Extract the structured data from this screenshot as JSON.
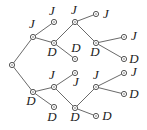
{
  "diagram": {
    "type": "tree",
    "nodes": [
      {
        "id": "root",
        "label": ""
      },
      {
        "id": "n1",
        "label": "J",
        "parent": "root"
      },
      {
        "id": "n2",
        "label": "D",
        "parent": "root"
      },
      {
        "id": "n3",
        "label": "J",
        "parent": "n1"
      },
      {
        "id": "n4",
        "label": "D",
        "parent": "n1"
      },
      {
        "id": "n5",
        "label": "J",
        "parent": "n4"
      },
      {
        "id": "n6",
        "label": "D",
        "parent": "n4"
      },
      {
        "id": "n7",
        "label": "J",
        "parent": "n5"
      },
      {
        "id": "n8",
        "label": "D",
        "parent": "n5"
      },
      {
        "id": "n9",
        "label": "J",
        "parent": "n8"
      },
      {
        "id": "n10",
        "label": "D",
        "parent": "n8"
      },
      {
        "id": "n11",
        "label": "J",
        "parent": "n2"
      },
      {
        "id": "n12",
        "label": "D",
        "parent": "n2"
      },
      {
        "id": "n13",
        "label": "J",
        "parent": "n11"
      },
      {
        "id": "n14",
        "label": "D",
        "parent": "n11"
      },
      {
        "id": "n15",
        "label": "J",
        "parent": "n14"
      },
      {
        "id": "n16",
        "label": "D",
        "parent": "n14"
      },
      {
        "id": "n17",
        "label": "J",
        "parent": "n15"
      },
      {
        "id": "n18",
        "label": "D",
        "parent": "n15"
      }
    ]
  }
}
